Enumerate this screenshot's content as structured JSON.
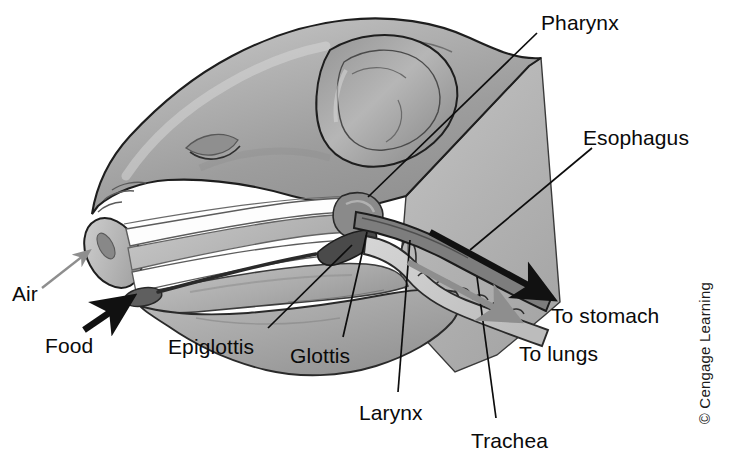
{
  "figure": {
    "background_color": "#ffffff",
    "width": 734,
    "height": 473
  },
  "labels": [
    {
      "id": "pharynx",
      "text": "Pharynx",
      "x": 541,
      "y": 12,
      "anchor": "start"
    },
    {
      "id": "esophagus",
      "text": "Esophagus",
      "x": 583,
      "y": 127,
      "anchor": "start"
    },
    {
      "id": "air",
      "text": "Air",
      "x": 12,
      "y": 283,
      "anchor": "start"
    },
    {
      "id": "food",
      "text": "Food",
      "x": 45,
      "y": 335,
      "anchor": "start"
    },
    {
      "id": "epiglottis",
      "text": "Epiglottis",
      "x": 168,
      "y": 336,
      "anchor": "start"
    },
    {
      "id": "glottis",
      "text": "Glottis",
      "x": 290,
      "y": 345,
      "anchor": "start"
    },
    {
      "id": "larynx",
      "text": "Larynx",
      "x": 359,
      "y": 402,
      "anchor": "start"
    },
    {
      "id": "trachea",
      "text": "Trachea",
      "x": 471,
      "y": 430,
      "anchor": "start"
    },
    {
      "id": "to_stomach",
      "text": "To stomach",
      "x": 551,
      "y": 305,
      "anchor": "start"
    },
    {
      "id": "to_lungs",
      "text": "To lungs",
      "x": 519,
      "y": 343,
      "anchor": "start"
    }
  ],
  "leader_lines": [
    {
      "id": "pharynx-leader",
      "from_label": "pharynx",
      "points": "537,33 368,197"
    },
    {
      "id": "esophagus-leader",
      "from_label": "esophagus",
      "points": "592,148 470,250"
    },
    {
      "id": "epiglottis-leader",
      "from_label": "epiglottis",
      "points": "268,328 352,245"
    },
    {
      "id": "glottis-leader",
      "from_label": "glottis",
      "points": "343,337 367,232"
    },
    {
      "id": "larynx-leader",
      "from_label": "larynx",
      "points": "398,392 410,240"
    },
    {
      "id": "trachea-leader",
      "from_label": "trachea",
      "points": "496,418 477,277"
    }
  ],
  "flow_arrows": [
    {
      "id": "air-inflow-arrow",
      "label_ref": "air",
      "color": "#8e8e8e",
      "style": "thin",
      "description": "gray arrow pointing up-right into the nostril"
    },
    {
      "id": "food-inflow-arrow",
      "label_ref": "food",
      "color": "#111111",
      "style": "thick",
      "description": "black arrow pointing up-right into the mouth"
    },
    {
      "id": "to-stomach-arrow",
      "label_ref": "to_stomach",
      "color": "#111111",
      "style": "thick",
      "description": "black arrow along esophagus pointing down-right"
    },
    {
      "id": "to-lungs-arrow",
      "label_ref": "to_lungs",
      "color": "#8e8e8e",
      "style": "thick",
      "description": "gray arrow along trachea pointing down-right"
    }
  ],
  "anatomy_parts": [
    {
      "id": "head",
      "name": "pig-head-profile",
      "fill": "#a8a8a8"
    },
    {
      "id": "ear",
      "name": "ear",
      "fill": "#9a9a9a"
    },
    {
      "id": "neck-cut-plane",
      "name": "neck-cut-section",
      "fill": "#b4b4b4"
    },
    {
      "id": "nasal-passage",
      "name": "nasal-passage",
      "fill": "#fdfdfd"
    },
    {
      "id": "hard-palate",
      "name": "hard-palate",
      "fill": "#bdbdbd"
    },
    {
      "id": "oral-cavity",
      "name": "oral-cavity",
      "fill": "#ffffff"
    },
    {
      "id": "tongue",
      "name": "tongue",
      "fill": "#b0b0b0"
    },
    {
      "id": "jaw",
      "name": "lower-jaw",
      "fill": "#a5a5a5"
    },
    {
      "id": "snout-tip",
      "name": "snout-cut-face",
      "fill": "#b8b8b8"
    },
    {
      "id": "food-bolus",
      "name": "food-bolus",
      "fill": "#6d6d6d"
    },
    {
      "id": "epiglottis-part",
      "name": "epiglottis-structure",
      "fill": "#7d7d7d"
    },
    {
      "id": "larynx-part",
      "name": "larynx-structure",
      "fill": "#8a8a8a"
    },
    {
      "id": "trachea-part",
      "name": "trachea-tube",
      "fill": "#c8c8c8"
    },
    {
      "id": "esophagus-part",
      "name": "esophagus-tube",
      "fill": "#7a7a7a"
    }
  ],
  "credit": {
    "text": "© Cengage Learning"
  },
  "colors": {
    "outline": "#1a1a1a",
    "body_gray": "#a8a8a8",
    "cut_plane_gray": "#b4b4b4",
    "air_arrow": "#8e8e8e",
    "food_arrow": "#111111",
    "text": "#0a0a0a"
  }
}
